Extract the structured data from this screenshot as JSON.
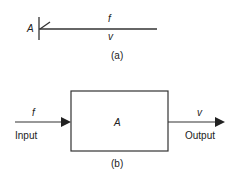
{
  "diagram_a": {
    "node_label": "A",
    "top_label": "f",
    "bottom_label": "v",
    "caption": "(a)"
  },
  "diagram_b": {
    "block_label": "A",
    "input_symbol": "f",
    "input_label": "Input",
    "output_symbol": "v",
    "output_label": "Output",
    "caption": "(b)"
  },
  "colors": {
    "stroke": "#333333",
    "text": "#222222",
    "background": "#ffffff"
  }
}
